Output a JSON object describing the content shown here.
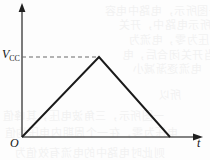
{
  "figure": {
    "name": "triangular-voltage-waveform",
    "background_color": "#fdfdfd",
    "ink_color": "#1a1a1a",
    "axis_color": "#4a4a4a",
    "dashed_color": "#6a6a6a"
  },
  "labels": {
    "y_axis_value": "V",
    "y_axis_value_subscript": "CC",
    "origin": "O",
    "x_axis": "t"
  },
  "chart_data": {
    "type": "line",
    "title": "",
    "xlabel": "t",
    "ylabel": "V_CC",
    "x": [
      0,
      1,
      2
    ],
    "values": [
      0,
      1,
      0
    ],
    "series": [
      {
        "name": "v(t)",
        "x": [
          0,
          1,
          2
        ],
        "values": [
          0,
          1,
          0
        ]
      }
    ],
    "xlim": [
      0,
      2.42
    ],
    "ylim": [
      0,
      1.24
    ],
    "x_tick_labels": [
      "O"
    ],
    "y_tick_labels": [
      "V_CC"
    ],
    "grid": false,
    "legend": "none",
    "annotations": [
      {
        "name": "vcc-dashed-guide",
        "type": "dashed-horizontal",
        "y": 1,
        "x_from": 0,
        "x_to": 1,
        "label": "V_CC"
      }
    ],
    "axis_arrows": {
      "x": true,
      "y": true
    }
  },
  "bleed_text": {
    "note": "faint show-through text from reverse side of scanned page",
    "lines": [
      {
        "text": "—一图所示，电路中电容",
        "left": 104,
        "top": 2,
        "size": 11
      },
      {
        "text": "如图所示电路中，开关",
        "left": 118,
        "top": 16,
        "size": 11
      },
      {
        "text": "电压为零，电流为",
        "left": 128,
        "top": 31,
        "size": 11
      },
      {
        "text": "当开关闭合后，电",
        "left": 122,
        "top": 46,
        "size": 11
      },
      {
        "text": "电流逐渐减小",
        "left": 132,
        "top": 60,
        "size": 11
      },
      {
        "text": "所以",
        "left": 158,
        "top": 86,
        "size": 11
      },
      {
        "text": "一图所示，三角波电压，其峰值",
        "left": 2,
        "top": 107,
        "size": 11
      },
      {
        "text": "电压为零，在一个周期内电压均值",
        "left": 4,
        "top": 124,
        "size": 11
      },
      {
        "text": "则此时电路中的电流有效值为",
        "left": 14,
        "top": 144,
        "size": 11
      }
    ]
  }
}
